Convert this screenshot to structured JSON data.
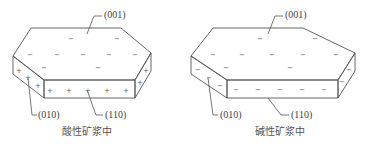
{
  "diagrams": [
    {
      "caption": "酸性矿浆中",
      "labels": {
        "top_face": "(001)",
        "side_face": "(010)",
        "front_face": "(110)"
      },
      "charges": {
        "top_face": "−",
        "side_faces": "+"
      }
    },
    {
      "caption": "碱性矿浆中",
      "labels": {
        "top_face": "(001)",
        "side_face": "(010)",
        "front_face": "(110)"
      },
      "charges": {
        "top_face": "−",
        "side_faces": "−"
      }
    }
  ],
  "colors": {
    "line": "#555555",
    "text": "#444444",
    "background": "#ffffff"
  }
}
